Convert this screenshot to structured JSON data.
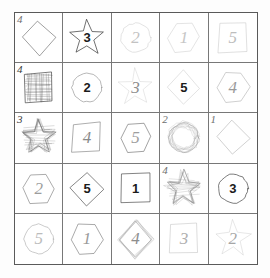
{
  "page": {
    "background_color": "#fdfdfd",
    "paper_color": "#ffffff",
    "grid_border_color": "#5a5a5a",
    "grid_line_color": "#787878",
    "rows": 5,
    "columns": 5
  },
  "palette": {
    "ink_dark": "#2b2b2b",
    "ink_medium": "#6b6b6b",
    "ink_light": "#b9b9b9",
    "ink_very_light": "#d2d2d2",
    "scribble_fill": "#7a7a7a"
  },
  "cells": [
    {
      "row": 1,
      "col": 1,
      "shape": "diamond",
      "digit": "",
      "digit_style": "none",
      "corner_mark": "4",
      "corner_shade": "medium",
      "stroke": "#4a4a4a",
      "stroke_width": 1.1,
      "scribbled": false,
      "name": "cell-r1c1"
    },
    {
      "row": 1,
      "col": 2,
      "shape": "star",
      "digit": "3",
      "digit_style": "bold",
      "corner_mark": "",
      "corner_shade": "medium",
      "stroke": "#2b2b2b",
      "stroke_width": 1.4,
      "scribbled": false,
      "name": "cell-r1c2"
    },
    {
      "row": 1,
      "col": 3,
      "shape": "circle",
      "digit": "2",
      "digit_style": "hand",
      "digit_color": "#c2c2c2",
      "corner_mark": "",
      "corner_shade": "light",
      "stroke": "#c9c9c9",
      "stroke_width": 1.1,
      "scribbled": false,
      "name": "cell-r1c3"
    },
    {
      "row": 1,
      "col": 4,
      "shape": "hexagon",
      "digit": "1",
      "digit_style": "hand",
      "digit_color": "#c6c6c6",
      "corner_mark": "",
      "corner_shade": "light",
      "stroke": "#cccccc",
      "stroke_width": 1.1,
      "scribbled": false,
      "name": "cell-r1c4"
    },
    {
      "row": 1,
      "col": 5,
      "shape": "square",
      "digit": "5",
      "digit_style": "hand",
      "digit_color": "#bdbdbd",
      "corner_mark": "",
      "corner_shade": "light",
      "stroke": "#c4c4c4",
      "stroke_width": 1.1,
      "scribbled": false,
      "name": "cell-r1c5"
    },
    {
      "row": 2,
      "col": 1,
      "shape": "square",
      "digit": "",
      "digit_style": "none",
      "corner_mark": "4",
      "corner_shade": "dark",
      "stroke": "#3f3f3f",
      "stroke_width": 1.4,
      "scribbled": true,
      "name": "cell-r2c1"
    },
    {
      "row": 2,
      "col": 2,
      "shape": "circle",
      "digit": "2",
      "digit_style": "bold",
      "corner_mark": "",
      "corner_shade": "medium",
      "stroke": "#8c8c8c",
      "stroke_width": 1.3,
      "scribbled": false,
      "name": "cell-r2c2"
    },
    {
      "row": 2,
      "col": 3,
      "shape": "star",
      "digit": "3",
      "digit_style": "hand",
      "digit_color": "#8e8e8e",
      "corner_mark": "",
      "corner_shade": "light",
      "stroke": "#d0d0d0",
      "stroke_width": 1.0,
      "scribbled": false,
      "name": "cell-r2c3"
    },
    {
      "row": 2,
      "col": 4,
      "shape": "diamond",
      "digit": "5",
      "digit_style": "bold",
      "corner_mark": "",
      "corner_shade": "light",
      "stroke": "#cbcbcb",
      "stroke_width": 1.1,
      "scribbled": false,
      "name": "cell-r2c4"
    },
    {
      "row": 2,
      "col": 5,
      "shape": "hexagon",
      "digit": "4",
      "digit_style": "hand",
      "digit_color": "#9a9a9a",
      "corner_mark": "",
      "corner_shade": "light",
      "stroke": "#aeaeae",
      "stroke_width": 1.2,
      "scribbled": false,
      "name": "cell-r2c5"
    },
    {
      "row": 3,
      "col": 1,
      "shape": "star",
      "digit": "",
      "digit_style": "none",
      "corner_mark": "3",
      "corner_shade": "dark",
      "stroke": "#6a6a6a",
      "stroke_width": 1.2,
      "scribbled": true,
      "name": "cell-r3c1"
    },
    {
      "row": 3,
      "col": 2,
      "shape": "square",
      "digit": "4",
      "digit_style": "hand",
      "digit_color": "#8a8a8a",
      "corner_mark": "",
      "corner_shade": "medium",
      "stroke": "#737373",
      "stroke_width": 1.2,
      "scribbled": false,
      "name": "cell-r3c2"
    },
    {
      "row": 3,
      "col": 3,
      "shape": "hexagon",
      "digit": "5",
      "digit_style": "hand",
      "digit_color": "#9e9e9e",
      "corner_mark": "",
      "corner_shade": "medium",
      "stroke": "#5f5f5f",
      "stroke_width": 1.2,
      "scribbled": false,
      "name": "cell-r3c3"
    },
    {
      "row": 3,
      "col": 4,
      "shape": "circle",
      "digit": "",
      "digit_style": "none",
      "corner_mark": "2",
      "corner_shade": "medium",
      "stroke": "#9a9a9a",
      "stroke_width": 1.2,
      "scribbled": true,
      "name": "cell-r3c4"
    },
    {
      "row": 3,
      "col": 5,
      "shape": "diamond",
      "digit": "",
      "digit_style": "none",
      "corner_mark": "1",
      "corner_shade": "medium",
      "stroke": "#a8a8a8",
      "stroke_width": 1.1,
      "scribbled": false,
      "name": "cell-r3c5"
    },
    {
      "row": 4,
      "col": 1,
      "shape": "hexagon",
      "digit": "2",
      "digit_style": "hand",
      "digit_color": "#9c9c9c",
      "corner_mark": "",
      "corner_shade": "medium",
      "stroke": "#6f6f6f",
      "stroke_width": 1.2,
      "scribbled": false,
      "name": "cell-r4c1"
    },
    {
      "row": 4,
      "col": 2,
      "shape": "diamond",
      "digit": "5",
      "digit_style": "bold",
      "corner_mark": "",
      "corner_shade": "medium",
      "stroke": "#3f3f3f",
      "stroke_width": 1.3,
      "scribbled": false,
      "name": "cell-r4c2"
    },
    {
      "row": 4,
      "col": 3,
      "shape": "square",
      "digit": "1",
      "digit_style": "bold",
      "corner_mark": "",
      "corner_shade": "medium",
      "stroke": "#3a3a3a",
      "stroke_width": 1.3,
      "scribbled": false,
      "name": "cell-r4c3"
    },
    {
      "row": 4,
      "col": 4,
      "shape": "star",
      "digit": "",
      "digit_style": "none",
      "corner_mark": "4",
      "corner_shade": "medium",
      "stroke": "#8a8a8a",
      "stroke_width": 1.2,
      "scribbled": true,
      "name": "cell-r4c4"
    },
    {
      "row": 4,
      "col": 5,
      "shape": "circle",
      "digit": "3",
      "digit_style": "bold",
      "corner_mark": "",
      "corner_shade": "medium",
      "stroke": "#2f2f2f",
      "stroke_width": 1.3,
      "scribbled": false,
      "name": "cell-r4c5"
    },
    {
      "row": 5,
      "col": 1,
      "shape": "circle",
      "digit": "5",
      "digit_style": "hand",
      "digit_color": "#bcbcbc",
      "corner_mark": "",
      "corner_shade": "light",
      "stroke": "#9d9d9d",
      "stroke_width": 1.1,
      "scribbled": false,
      "name": "cell-r5c1"
    },
    {
      "row": 5,
      "col": 2,
      "shape": "hexagon",
      "digit": "1",
      "digit_style": "hand",
      "digit_color": "#9a9a9a",
      "corner_mark": "",
      "corner_shade": "medium",
      "stroke": "#6d6d6d",
      "stroke_width": 1.2,
      "scribbled": false,
      "name": "cell-r5c2"
    },
    {
      "row": 5,
      "col": 3,
      "shape": "diamond",
      "digit": "4",
      "digit_style": "hand",
      "digit_color": "#8d8d8d",
      "corner_mark": "",
      "corner_shade": "medium",
      "stroke": "#a0a0a0",
      "stroke_width": 1.2,
      "scribbled": true,
      "name": "cell-r5c3"
    },
    {
      "row": 5,
      "col": 4,
      "shape": "square",
      "digit": "3",
      "digit_style": "hand",
      "digit_color": "#b0b0b0",
      "corner_mark": "",
      "corner_shade": "light",
      "stroke": "#c0c0c0",
      "stroke_width": 1.1,
      "scribbled": false,
      "name": "cell-r5c4"
    },
    {
      "row": 5,
      "col": 5,
      "shape": "star",
      "digit": "2",
      "digit_style": "hand",
      "digit_color": "#a6a6a6",
      "corner_mark": "",
      "corner_shade": "light",
      "stroke": "#cfcfcf",
      "stroke_width": 1.0,
      "scribbled": false,
      "name": "cell-r5c5"
    }
  ]
}
